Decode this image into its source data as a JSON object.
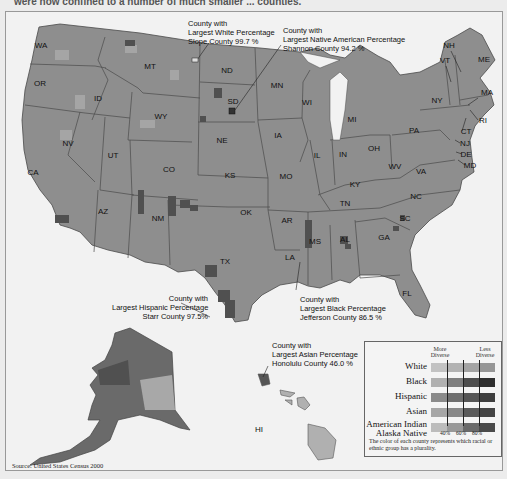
{
  "header": {
    "intro_text_fragment": "were now confined to a number of much smaller ... counties."
  },
  "map": {
    "title": "Racial/ethnic plurality by county, United States Census 2000",
    "colors": {
      "background": "#f2f2f2",
      "land": "#8e8e8e",
      "border": "#4a4a4a",
      "dark": "#555555",
      "light": "#b4b4b4"
    },
    "state_labels": [
      {
        "id": "WA",
        "x": 41,
        "y": 48
      },
      {
        "id": "OR",
        "x": 40,
        "y": 86
      },
      {
        "id": "ID",
        "x": 98,
        "y": 101
      },
      {
        "id": "MT",
        "x": 150,
        "y": 69
      },
      {
        "id": "WY",
        "x": 161,
        "y": 119
      },
      {
        "id": "NV",
        "x": 68,
        "y": 146
      },
      {
        "id": "UT",
        "x": 113,
        "y": 158
      },
      {
        "id": "CA",
        "x": 33,
        "y": 175
      },
      {
        "id": "CO",
        "x": 169,
        "y": 172
      },
      {
        "id": "AZ",
        "x": 103,
        "y": 214
      },
      {
        "id": "NM",
        "x": 158,
        "y": 221
      },
      {
        "id": "ND",
        "x": 227,
        "y": 73
      },
      {
        "id": "SD",
        "x": 233,
        "y": 104
      },
      {
        "id": "NE",
        "x": 222,
        "y": 143
      },
      {
        "id": "KS",
        "x": 230,
        "y": 178
      },
      {
        "id": "OK",
        "x": 246,
        "y": 215
      },
      {
        "id": "TX",
        "x": 225,
        "y": 264
      },
      {
        "id": "MN",
        "x": 277,
        "y": 88
      },
      {
        "id": "IA",
        "x": 278,
        "y": 138
      },
      {
        "id": "MO",
        "x": 286,
        "y": 179
      },
      {
        "id": "AR",
        "x": 287,
        "y": 223
      },
      {
        "id": "LA",
        "x": 290,
        "y": 260
      },
      {
        "id": "WI",
        "x": 307,
        "y": 105
      },
      {
        "id": "IL",
        "x": 317,
        "y": 158
      },
      {
        "id": "MS",
        "x": 315,
        "y": 244
      },
      {
        "id": "AL",
        "x": 345,
        "y": 242
      },
      {
        "id": "TN",
        "x": 345,
        "y": 206
      },
      {
        "id": "KY",
        "x": 355,
        "y": 187
      },
      {
        "id": "IN",
        "x": 343,
        "y": 157
      },
      {
        "id": "OH",
        "x": 374,
        "y": 151
      },
      {
        "id": "MI",
        "x": 352,
        "y": 122
      },
      {
        "id": "GA",
        "x": 384,
        "y": 240
      },
      {
        "id": "FL",
        "x": 407,
        "y": 296
      },
      {
        "id": "SC",
        "x": 405,
        "y": 221
      },
      {
        "id": "NC",
        "x": 416,
        "y": 199
      },
      {
        "id": "VA",
        "x": 421,
        "y": 174
      },
      {
        "id": "WV",
        "x": 395,
        "y": 169
      },
      {
        "id": "PA",
        "x": 414,
        "y": 133
      },
      {
        "id": "NY",
        "x": 437,
        "y": 103
      },
      {
        "id": "VT",
        "x": 445,
        "y": 63
      },
      {
        "id": "NH",
        "x": 449,
        "y": 48
      },
      {
        "id": "ME",
        "x": 484,
        "y": 62
      },
      {
        "id": "MA",
        "x": 487,
        "y": 95
      },
      {
        "id": "RI",
        "x": 483,
        "y": 123
      },
      {
        "id": "CT",
        "x": 466,
        "y": 134
      },
      {
        "id": "NJ",
        "x": 465,
        "y": 146
      },
      {
        "id": "DE",
        "x": 466,
        "y": 157
      },
      {
        "id": "MD",
        "x": 470,
        "y": 168
      },
      {
        "id": "HI",
        "x": 259,
        "y": 432
      }
    ],
    "annotations": [
      {
        "id": "white",
        "lines": [
          "County with",
          "Largest White Percentage",
          "Slope County  99.7 %"
        ]
      },
      {
        "id": "native",
        "lines": [
          "County with",
          "Largest Native American Percentage",
          "Shannon County  94.2 %"
        ]
      },
      {
        "id": "hispanic",
        "lines": [
          "County with",
          "Largest Hispanic Percentage",
          "Starr County  97.5%"
        ]
      },
      {
        "id": "black",
        "lines": [
          "County with",
          "Largest Black Percentage",
          "Jefferson County  86.5 %"
        ]
      },
      {
        "id": "asian",
        "lines": [
          "County with",
          "Largest Asian Percentage",
          "Honolulu County  46.0 %"
        ]
      }
    ]
  },
  "legend": {
    "more_diverse": "More Diverse",
    "less_diverse": "Less Diverse",
    "rows": [
      {
        "label": "White",
        "shades": [
          "#c2c2c2",
          "#b2b2b2",
          "#a4a4a4",
          "#969696"
        ]
      },
      {
        "label": "Black",
        "shades": [
          "#b0b0b0",
          "#7e7e7e",
          "#4e4e4e",
          "#2e2e2e"
        ]
      },
      {
        "label": "Hispanic",
        "shades": [
          "#8a8a8a",
          "#6e6e6e",
          "#555555",
          "#3e3e3e"
        ]
      },
      {
        "label": "Asian",
        "shades": [
          "#a6a6a6",
          "#888888",
          "#5a5a5a",
          "#444444"
        ]
      },
      {
        "label": "American Indian\nAlaska Native",
        "label_line1": "American Indian",
        "label_line2": "Alaska Native",
        "shades": [
          "#bcbcbc",
          "#999999",
          "#6a6a6a",
          "#4a4a4a"
        ]
      }
    ],
    "ticks": [
      "40%",
      "60%",
      "80%"
    ],
    "note": "The color of each county represents which racial or ethnic group has a plurality."
  },
  "source": "Source: United States Census 2000"
}
